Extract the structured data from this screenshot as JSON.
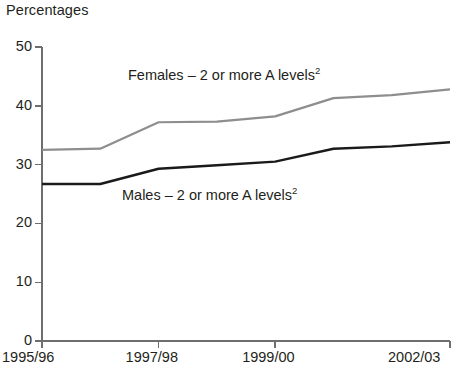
{
  "chart_data": {
    "type": "line",
    "title": "Percentages",
    "xlabel": "",
    "ylabel": "Percentages",
    "ylim": [
      0,
      50
    ],
    "yticks": [
      0,
      10,
      20,
      30,
      40,
      50
    ],
    "grid": false,
    "legend_position": "inline-annotation",
    "x": [
      "1995/96",
      "1996/97",
      "1997/98",
      "1998/99",
      "1999/00",
      "2000/01",
      "2001/02",
      "2002/03"
    ],
    "xtick_labels": [
      "1995/96",
      "1997/98",
      "1999/00",
      "2002/03"
    ],
    "xtick_values": [
      "1995/96",
      "1997/98",
      "1999/00",
      "2002/03"
    ],
    "series": [
      {
        "name": "Females – 2 or more A levels",
        "footnote": "2",
        "color": "#8e8e8e",
        "values": [
          32.5,
          32.7,
          37.2,
          37.3,
          38.2,
          41.3,
          41.8,
          42.8
        ]
      },
      {
        "name": "Males – 2 or more A levels",
        "footnote": "2",
        "color": "#1a1a1a",
        "values": [
          26.7,
          26.7,
          29.3,
          29.9,
          30.5,
          32.7,
          33.1,
          33.8
        ]
      }
    ],
    "annotations": [
      {
        "text": "Females – 2 or more A levels",
        "sup": "2",
        "x_px": 128,
        "y_px": 68
      },
      {
        "text": "Males – 2 or more A levels",
        "sup": "2",
        "x_px": 122,
        "y_px": 188
      }
    ],
    "axis_color": "#6e6e6e"
  }
}
